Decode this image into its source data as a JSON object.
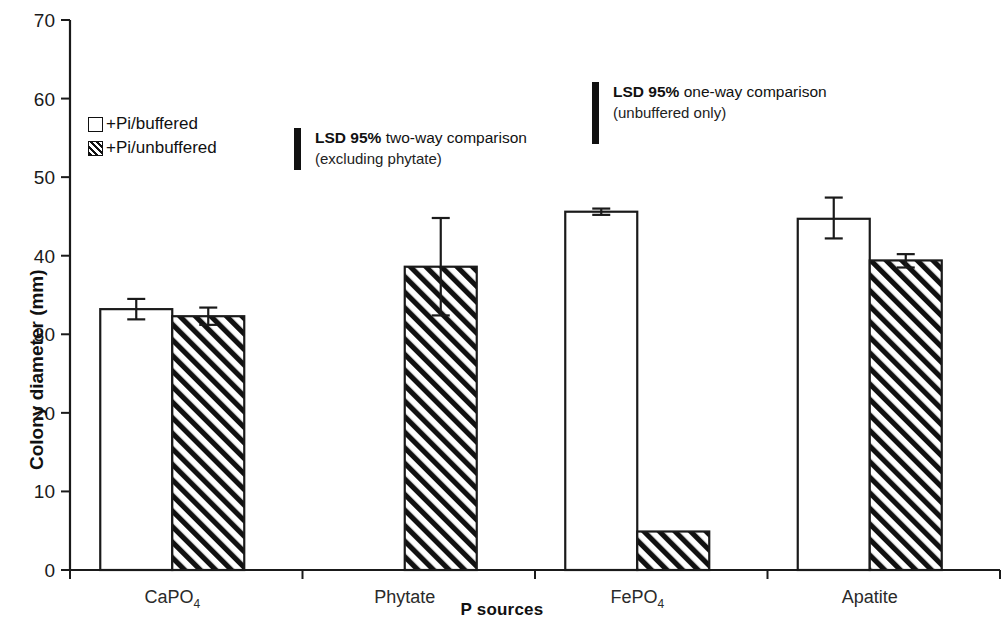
{
  "chart_data": {
    "type": "bar",
    "title": "",
    "xlabel": "P sources",
    "ylabel": "Colony diameter (mm)",
    "ylim": [
      0,
      70
    ],
    "ytick_interval": 10,
    "yticks": [
      "0",
      "10",
      "20",
      "30",
      "40",
      "50",
      "60",
      "70"
    ],
    "grid": false,
    "legend_position": "upper-left-inside",
    "categories": [
      "CaPO4",
      "Phytate",
      "FePO4",
      "Apatite"
    ],
    "category_labels": [
      {
        "base": "CaPO",
        "sub": "4"
      },
      {
        "base": "Phytate",
        "sub": ""
      },
      {
        "base": "FePO",
        "sub": "4"
      },
      {
        "base": "Apatite",
        "sub": ""
      }
    ],
    "series": [
      {
        "name": "+Pi/buffered",
        "fill": "white",
        "values": [
          33.2,
          null,
          45.6,
          44.7
        ],
        "errors_low": [
          31.9,
          null,
          45.2,
          42.2
        ],
        "errors_high": [
          34.5,
          null,
          46.0,
          47.4
        ]
      },
      {
        "name": "+Pi/unbuffered",
        "fill": "hatched",
        "values": [
          32.3,
          38.6,
          4.9,
          39.4
        ],
        "errors_low": [
          31.2,
          32.4,
          4.9,
          38.5
        ],
        "errors_high": [
          33.4,
          44.8,
          4.9,
          40.2
        ]
      }
    ],
    "annotations": [
      {
        "id": "two-way",
        "line1_bold": "LSD 95%",
        "line1_rest": " two-way comparison",
        "line2": "(excluding phytate)",
        "marker": "vertical-bar",
        "marker_span_units": 5.3
      },
      {
        "id": "one-way",
        "line1_bold": "LSD 95%",
        "line1_rest": " one-way comparison",
        "line2": "(unbuffered only)",
        "marker": "vertical-bar",
        "marker_span_units": 7.9
      }
    ]
  },
  "legend": {
    "items": [
      {
        "label": "+Pi/buffered",
        "swatch": "white-square"
      },
      {
        "label": "+Pi/unbuffered",
        "swatch": "hatched-square"
      }
    ]
  },
  "colors": {
    "ink": "#111111",
    "bar_fill_white": "#ffffff",
    "hatch": "#111111",
    "background": "#ffffff"
  }
}
